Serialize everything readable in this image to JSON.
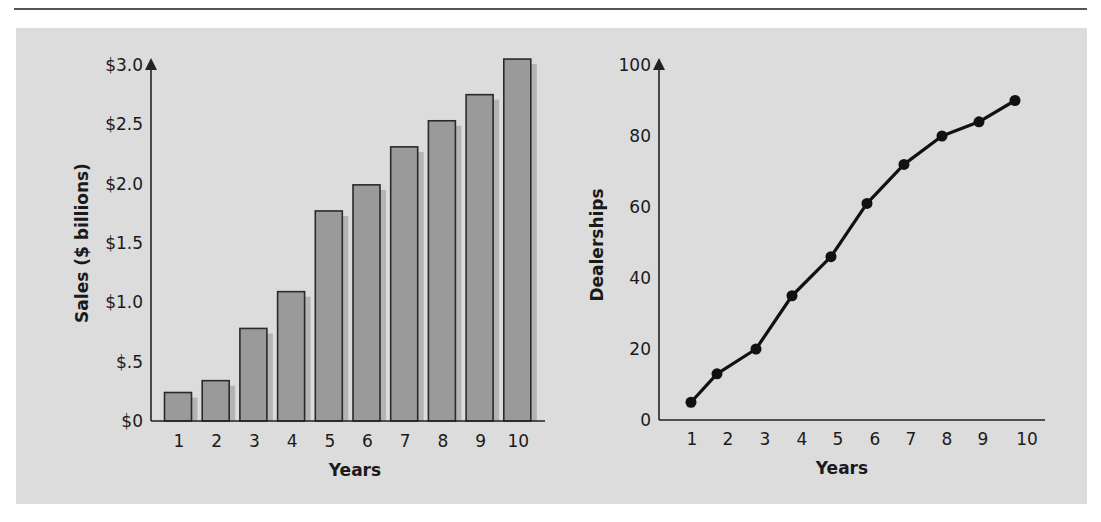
{
  "chart_data": [
    {
      "type": "bar",
      "title": "",
      "xlabel": "Years",
      "ylabel": "Sales ($ billions)",
      "categories": [
        "1",
        "2",
        "3",
        "4",
        "5",
        "6",
        "7",
        "8",
        "9",
        "10"
      ],
      "values": [
        0.24,
        0.34,
        0.78,
        1.09,
        1.77,
        1.99,
        2.31,
        2.53,
        2.75,
        3.05
      ],
      "ylim": [
        0,
        3.0
      ],
      "yticks": [
        "$0",
        "$.5",
        "$1.0",
        "$1.5",
        "$2.0",
        "$2.5",
        "$3.0"
      ],
      "ytick_values": [
        0,
        0.5,
        1.0,
        1.5,
        2.0,
        2.5,
        3.0
      ],
      "grid": false,
      "legend": null
    },
    {
      "type": "line",
      "title": "",
      "xlabel": "Years",
      "ylabel": "Dealerships",
      "x": [
        1,
        2,
        3,
        4,
        5,
        6,
        7,
        8,
        9,
        10
      ],
      "values": [
        5,
        13,
        20,
        35,
        46,
        61,
        72,
        80,
        84,
        90
      ],
      "ylim": [
        0,
        100
      ],
      "yticks": [
        "0",
        "20",
        "40",
        "60",
        "80",
        "100"
      ],
      "ytick_values": [
        0,
        20,
        40,
        60,
        80,
        100
      ],
      "grid": false,
      "legend": null
    }
  ],
  "colors": {
    "panel": "#dcdcdc",
    "bar_fill": "#9a9a9a",
    "bar_shadow": "#b4b4b4",
    "bar_stroke": "#2a2a2a",
    "line": "#111111",
    "axis": "#222222"
  }
}
